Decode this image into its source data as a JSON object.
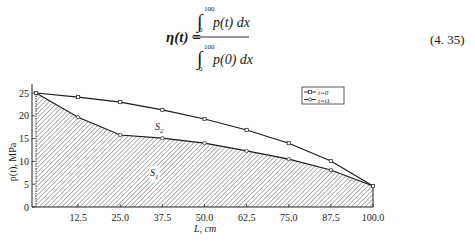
{
  "equation": {
    "lhs": "η(t) =",
    "numerator": {
      "integral": "∫",
      "upper_limit": "100",
      "lower_limit": "0",
      "integrand": "p(t) dx"
    },
    "denominator": {
      "integral": "∫",
      "upper_limit": "100",
      "lower_limit": "0",
      "integrand": "p(0) dx"
    },
    "number": "(4. 35)"
  },
  "chart_data": {
    "type": "line",
    "title": "",
    "xlabel": "L, cm",
    "ylabel": "p(t), MPa",
    "x": [
      0,
      12.5,
      25.0,
      37.5,
      50.0,
      62.5,
      75.0,
      87.5,
      100.0
    ],
    "x_tick_labels": [
      "12.5",
      "25.0",
      "37.5",
      "50.0",
      "62.5",
      "75.0",
      "87.5",
      "100.0"
    ],
    "y_tick_labels": [
      "0",
      "5",
      "10",
      "15",
      "20",
      "25"
    ],
    "xlim": [
      0,
      100
    ],
    "ylim": [
      0,
      25
    ],
    "grid": false,
    "legend_position": "top-right",
    "series": [
      {
        "name": "t=0",
        "marker": "square",
        "values": [
          25.0,
          24.1,
          23.0,
          21.3,
          19.3,
          16.9,
          14.0,
          10.1,
          4.6
        ]
      },
      {
        "name": "t=t1",
        "marker": "circle",
        "values": [
          25.0,
          19.7,
          15.8,
          15.1,
          14.0,
          12.3,
          10.5,
          8.1,
          4.6
        ]
      }
    ],
    "annotations": [
      {
        "text": "S2",
        "region": "between curves"
      },
      {
        "text": "S1",
        "region": "under t=t1 curve (hatched)"
      }
    ],
    "legend": [
      {
        "label": "t=0",
        "symbol": "-□-"
      },
      {
        "label": "t=t1",
        "symbol": "-○-"
      }
    ]
  }
}
